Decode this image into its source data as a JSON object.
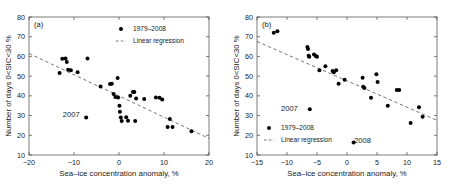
{
  "figure": {
    "panels": [
      {
        "tag": "(a)",
        "xlabel": "Sea–ice concentration anomaly, %",
        "ylabel": "Number of days 0<SIC<30 %",
        "legend": {
          "position": "top-right",
          "marker_label": "1979–2008",
          "line_label": "Linear regression"
        },
        "annotations": [
          {
            "text": "2007",
            "x": -10.6,
            "y": 30.6
          }
        ]
      },
      {
        "tag": "(b)",
        "xlabel": "Sea–ice concentration anomaly, %",
        "ylabel": "Number of days 0<SIC<30 %",
        "legend": {
          "position": "bottom-left",
          "marker_label": "1979–2008",
          "line_label": "Linear regression"
        },
        "annotations": [
          {
            "text": "2007",
            "x": -9.6,
            "y": 33.8
          },
          {
            "text": "2008",
            "x": 2.6,
            "y": 17.4
          }
        ]
      }
    ]
  },
  "chart_data": [
    {
      "type": "scatter",
      "title": "(a)",
      "xlabel": "Sea–ice concentration anomaly, %",
      "ylabel": "Number of days 0<SIC<30 %",
      "xlim": [
        -20,
        20
      ],
      "ylim": [
        10,
        80
      ],
      "xticks": [
        -20,
        -10,
        0,
        10,
        20
      ],
      "yticks": [
        10,
        20,
        30,
        40,
        50,
        60,
        70,
        80
      ],
      "xticklabels": [
        "−20",
        "−10",
        "0",
        "10",
        "20"
      ],
      "yticklabels": [
        "10",
        "20",
        "30",
        "40",
        "50",
        "60",
        "70",
        "80"
      ],
      "grid": false,
      "legend_position": "top-right",
      "series": [
        {
          "name": "1979–2008",
          "marker": "circle",
          "color": "#000000",
          "points": [
            {
              "x": -13.2,
              "y": 51.6
            },
            {
              "x": -12.6,
              "y": 58.8
            },
            {
              "x": -11.9,
              "y": 58.9
            },
            {
              "x": -11.6,
              "y": 57.2
            },
            {
              "x": -11.3,
              "y": 53.2
            },
            {
              "x": -10.7,
              "y": 53.0
            },
            {
              "x": -9.2,
              "y": 52.0
            },
            {
              "x": -7.3,
              "y": 29.0
            },
            {
              "x": -7.0,
              "y": 58.9
            },
            {
              "x": -4.1,
              "y": 44.8
            },
            {
              "x": -2.0,
              "y": 46.0
            },
            {
              "x": -1.6,
              "y": 46.2
            },
            {
              "x": -1.2,
              "y": 41.0
            },
            {
              "x": -0.8,
              "y": 39.4
            },
            {
              "x": -0.3,
              "y": 49.1
            },
            {
              "x": -0.2,
              "y": 39.2
            },
            {
              "x": 0.1,
              "y": 35.0
            },
            {
              "x": 0.2,
              "y": 32.0
            },
            {
              "x": 0.4,
              "y": 29.0
            },
            {
              "x": 0.6,
              "y": 27.2
            },
            {
              "x": 1.6,
              "y": 29.2
            },
            {
              "x": 2.0,
              "y": 27.4
            },
            {
              "x": 2.5,
              "y": 40.0
            },
            {
              "x": 3.1,
              "y": 41.9
            },
            {
              "x": 3.4,
              "y": 42.0
            },
            {
              "x": 3.6,
              "y": 27.2
            },
            {
              "x": 3.8,
              "y": 38.6
            },
            {
              "x": 5.6,
              "y": 38.4
            },
            {
              "x": 8.2,
              "y": 39.2
            },
            {
              "x": 9.0,
              "y": 39.1
            },
            {
              "x": 9.6,
              "y": 38.2
            },
            {
              "x": 10.8,
              "y": 24.2
            },
            {
              "x": 11.3,
              "y": 28.2
            },
            {
              "x": 11.9,
              "y": 24.2
            },
            {
              "x": 16.1,
              "y": 22.1
            }
          ]
        }
      ],
      "regression": {
        "label": "Linear regression",
        "style": "dashed",
        "color": "#555555",
        "x_start": -20,
        "y_start": 61.5,
        "x_end": 20,
        "y_end": 18.4
      },
      "annotations": [
        {
          "text": "2007",
          "x": -10.6,
          "y": 30.6
        }
      ]
    },
    {
      "type": "scatter",
      "title": "(b)",
      "xlabel": "Sea–ice concentration anomaly, %",
      "ylabel": "Number of days 0<SIC<30 %",
      "xlim": [
        -15,
        15
      ],
      "ylim": [
        10,
        80
      ],
      "xticks": [
        -15,
        -10,
        -5,
        0,
        5,
        10,
        15
      ],
      "yticks": [
        10,
        20,
        30,
        40,
        50,
        60,
        70,
        80
      ],
      "xticklabels": [
        "−15",
        "−10",
        "−5",
        "0",
        "5",
        "10",
        "15"
      ],
      "yticklabels": [
        "10",
        "20",
        "30",
        "40",
        "50",
        "60",
        "70",
        "80"
      ],
      "grid": false,
      "legend_position": "bottom-left",
      "series": [
        {
          "name": "1979–2008",
          "marker": "circle",
          "color": "#000000",
          "points": [
            {
              "x": -12.2,
              "y": 72.0
            },
            {
              "x": -11.6,
              "y": 72.8
            },
            {
              "x": -6.6,
              "y": 64.8
            },
            {
              "x": -6.5,
              "y": 63.8
            },
            {
              "x": -6.4,
              "y": 60.4
            },
            {
              "x": -6.3,
              "y": 59.8
            },
            {
              "x": -6.2,
              "y": 33.2
            },
            {
              "x": -5.5,
              "y": 61.0
            },
            {
              "x": -5.2,
              "y": 60.2
            },
            {
              "x": -5.0,
              "y": 59.9
            },
            {
              "x": -4.6,
              "y": 53.0
            },
            {
              "x": -3.6,
              "y": 55.0
            },
            {
              "x": -2.4,
              "y": 52.6
            },
            {
              "x": -2.2,
              "y": 52.0
            },
            {
              "x": -1.8,
              "y": 53.0
            },
            {
              "x": -1.4,
              "y": 46.2
            },
            {
              "x": -0.4,
              "y": 48.2
            },
            {
              "x": 1.1,
              "y": 16.4
            },
            {
              "x": 2.6,
              "y": 49.2
            },
            {
              "x": 2.7,
              "y": 44.6
            },
            {
              "x": 2.9,
              "y": 44.0
            },
            {
              "x": 4.0,
              "y": 39.0
            },
            {
              "x": 4.9,
              "y": 51.0
            },
            {
              "x": 5.1,
              "y": 47.0
            },
            {
              "x": 6.8,
              "y": 35.0
            },
            {
              "x": 8.3,
              "y": 43.0
            },
            {
              "x": 8.7,
              "y": 43.0
            },
            {
              "x": 10.6,
              "y": 26.2
            },
            {
              "x": 12.0,
              "y": 34.2
            },
            {
              "x": 12.6,
              "y": 29.4
            }
          ]
        }
      ],
      "regression": {
        "label": "Linear regression",
        "style": "dashed",
        "color": "#555555",
        "x_start": -15,
        "y_start": 67.6,
        "x_end": 15,
        "y_end": 27.6
      },
      "annotations": [
        {
          "text": "2007",
          "x": -9.6,
          "y": 33.8
        },
        {
          "text": "2008",
          "x": 2.6,
          "y": 17.4
        }
      ]
    }
  ]
}
